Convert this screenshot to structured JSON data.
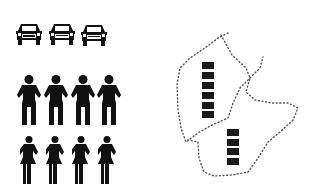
{
  "colors": {
    "ink": "#111111",
    "background": "#ffffff",
    "dots": "#555555"
  },
  "cars": {
    "count": 3,
    "icon": "car-front-icon",
    "positions": [
      {
        "x": 15,
        "y": 22
      },
      {
        "x": 48,
        "y": 22
      },
      {
        "x": 80,
        "y": 23
      }
    ]
  },
  "men": {
    "count": 4,
    "icon": "man-icon",
    "positions": [
      {
        "x": 17,
        "y": 76
      },
      {
        "x": 44,
        "y": 76
      },
      {
        "x": 71,
        "y": 76
      },
      {
        "x": 97,
        "y": 76
      }
    ]
  },
  "women": {
    "count": 4,
    "icon": "woman-icon",
    "positions": [
      {
        "x": 20,
        "y": 136
      },
      {
        "x": 46,
        "y": 136
      },
      {
        "x": 72,
        "y": 136
      },
      {
        "x": 98,
        "y": 136
      }
    ]
  },
  "regions": [
    {
      "name": "upper-left-region",
      "blocks": 6,
      "block_x": 202,
      "block_y": 62
    },
    {
      "name": "lower-right-region",
      "blocks": 4,
      "block_x": 227,
      "block_y": 129
    }
  ]
}
